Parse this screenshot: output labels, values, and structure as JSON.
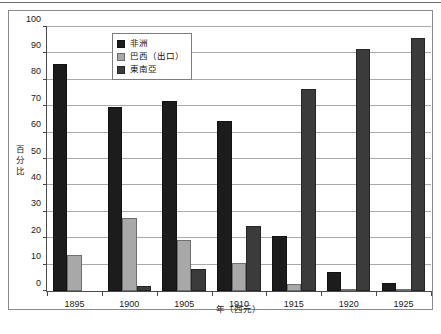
{
  "chart_data": {
    "type": "bar",
    "title": "",
    "subtitle": "",
    "xlabel": "年（西元）",
    "ylabel": "百分比",
    "categories": [
      "1895",
      "1900",
      "1905",
      "1910",
      "1915",
      "1920",
      "1925"
    ],
    "ylim": [
      0,
      100
    ],
    "ytick_step": 10,
    "yticks": [
      "0",
      "10",
      "20",
      "30",
      "40",
      "50",
      "60",
      "70",
      "80",
      "90",
      "100"
    ],
    "grid": true,
    "grid_axis": "y",
    "legend_position": "top-left-inside",
    "series": [
      {
        "name": "非洲",
        "color": "#1c1c1c",
        "values": [
          86,
          69.8,
          72,
          64.3,
          20.7,
          7.2,
          3.1
        ]
      },
      {
        "name": "巴西（出口）",
        "color": "#a8a8a8",
        "values": [
          13.7,
          27.8,
          19.2,
          10.6,
          2.5,
          0.5,
          0.4
        ]
      },
      {
        "name": "東南亞",
        "color": "#3b3b3b",
        "values": [
          0,
          2,
          8.3,
          24.5,
          76.4,
          91.8,
          96
        ]
      }
    ]
  },
  "legend": {
    "items": [
      {
        "label": "非洲"
      },
      {
        "label": "巴西（出口）"
      },
      {
        "label": "東南亞"
      }
    ]
  },
  "axes": {
    "y_title": "百分比",
    "x_title": "年（西元）"
  }
}
